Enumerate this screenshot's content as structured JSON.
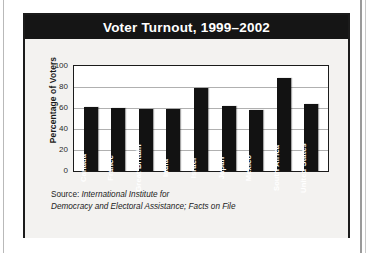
{
  "figure": {
    "title": "Voter Turnout, 1999–2002",
    "source_lead": "Source: ",
    "source_cite_line1": "International Institute for",
    "source_cite_line2": "Democracy and Electoral Assistance; Facts on File"
  },
  "colors": {
    "title_bar": "#151515",
    "title_text": "#ffffff",
    "bar_fill": "#121212",
    "panel": "#f3f2f0",
    "plot_bg": "#ffffff",
    "gridline": "#b0b0b0",
    "frame": "#1b1b1b"
  },
  "chart_data": {
    "type": "bar",
    "title": "Voter Turnout, 1999–2002",
    "xlabel": "",
    "ylabel": "Percentage of Voters",
    "ylim": [
      0,
      100
    ],
    "yticks": [
      0,
      20,
      40,
      60,
      80,
      100
    ],
    "grid": true,
    "legend": "none",
    "orientation": "vertical",
    "categories": [
      "Canada",
      "France",
      "Great Britain",
      "India",
      "Israel",
      "Japan",
      "Mexico",
      "South Africa",
      "United States"
    ],
    "values": [
      61,
      60,
      59,
      59,
      79,
      62,
      58,
      89,
      64
    ],
    "units": "percent"
  }
}
